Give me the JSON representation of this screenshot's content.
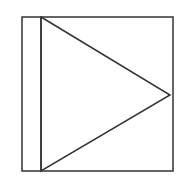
{
  "diagram": {
    "stroke_color": "#333333",
    "background": "#ffffff",
    "outer_rect": {
      "x": 22,
      "y": 17,
      "width": 151,
      "height": 154
    },
    "divider_line": {
      "x1": 41,
      "y1": 17,
      "x2": 41,
      "y2": 171
    },
    "triangle": {
      "points": "41,17 170,95 41,171"
    }
  }
}
